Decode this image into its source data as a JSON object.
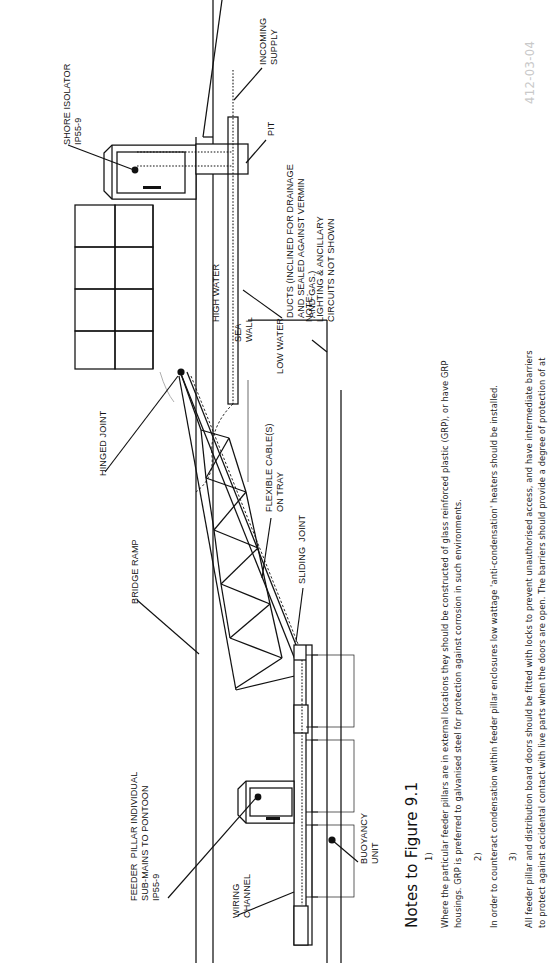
{
  "figure": {
    "reference_number": "412-03-04"
  },
  "diagram_labels": {
    "shore_isolator": "SHORE ISOLATOR\nIP55-9",
    "incoming_supply": "INCOMING\nSUPPLY",
    "pit": "PIT",
    "ducts": "DUCTS (INCLINED FOR DRAINAGE\nAND SEALED AGAINST VERMIN\nAND GAS.)",
    "note_block": "NOTE:\nLIGHTING & ANCILLARY\nCIRCUITS NOT SHOWN",
    "high_water": "HIGH WATER",
    "sea_wall": "SEA\nWALL",
    "low_water": "LOW WATER",
    "hinged_joint": "HINGED JOINT",
    "bridge_ramp": "BRIDGE RAMP",
    "flexible_cables": "FLEXIBLE CABLE(S)\nON TRAY",
    "sliding_joint": "SLIDING  JOINT",
    "feeder_pillar": "FEEDER  PILLAR INDIVIDUAL\nSUB-MAINS TO PONTOON\nIP55-9",
    "wiring_channel": "WIRING\nCHANNEL",
    "buoyancy_unit": "BUOYANCY\nUNIT"
  },
  "notes": {
    "heading": "Notes to Figure 9.1",
    "items": [
      {
        "number": "1)",
        "lines": [
          "Where the particular feeder pillars are in external locations they should be constructed of glass reinforced plastic (GRP), or have GRP",
          "housings. GRP is preferred to galvanised steel for protection against corrosion in such environments."
        ]
      },
      {
        "number": "2)",
        "lines": [
          "In order to counteract condensation within feeder pillar enclosures low wattage 'anti-condensation' heaters should be installed."
        ]
      },
      {
        "number": "3)",
        "lines": [
          "All feeder pillar and distribution board doors should be fitted with locks to prevent unauthorised access, and have intermediate barriers",
          "to protect against accidental contact with live parts when the doors are open. The barriers should provide a degree of protection of at"
        ]
      }
    ]
  },
  "colors": {
    "ink": "#111111",
    "reference": "#c9c9c9",
    "cable_tray_grey": "#9d9d9d"
  }
}
